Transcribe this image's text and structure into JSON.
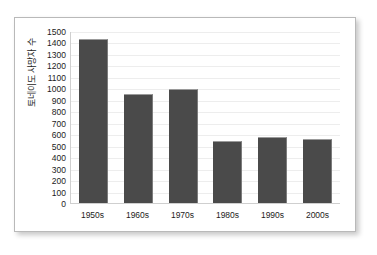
{
  "chart_data": {
    "type": "bar",
    "title": "",
    "subtitle": "",
    "xlabel": "",
    "ylabel": "토네이도 사망자 수",
    "categories": [
      "1950s",
      "1960s",
      "1970s",
      "1980s",
      "1990s",
      "2000s"
    ],
    "values": [
      1430,
      950,
      990,
      540,
      572,
      555
    ],
    "series": [
      {
        "name": "토네이도 사망자 수",
        "values": [
          1430,
          950,
          990,
          540,
          572,
          555
        ]
      }
    ],
    "ylim": [
      0,
      1500
    ],
    "y_tick_step": 100,
    "y_ticks": [
      0,
      100,
      200,
      300,
      400,
      500,
      600,
      700,
      800,
      900,
      1000,
      1100,
      1200,
      1300,
      1400,
      1500
    ],
    "y_tick_labels": [
      "0",
      "100",
      "200",
      "300",
      "400",
      "500",
      "600",
      "700",
      "800",
      "900",
      "1000",
      "1100",
      "1200",
      "1300",
      "1400",
      "1500"
    ],
    "grid": true,
    "grid_axis": "y",
    "legend": false,
    "legend_position": "none",
    "bar_color": "#4a4a4a",
    "plot_background": "#ffffff",
    "gridline_color": "#ededed",
    "axis_color": "#cfcfcf",
    "text_color": "#1c1c1c",
    "card_border_color": "#b9b9b9"
  }
}
